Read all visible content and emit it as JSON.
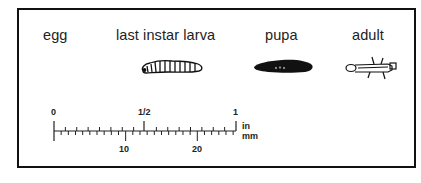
{
  "figure": {
    "stages": [
      {
        "id": "egg",
        "label": "egg"
      },
      {
        "id": "larva",
        "label": "last instar larva"
      },
      {
        "id": "pupa",
        "label": "pupa"
      },
      {
        "id": "adult",
        "label": "adult"
      }
    ],
    "scale_bar": {
      "inch_labels": [
        "0",
        "1/2",
        "1"
      ],
      "mm_labels": [
        "10",
        "20"
      ],
      "unit_top": "in",
      "unit_bottom": "mm",
      "mm_range": [
        0,
        25
      ],
      "inch_range": [
        0,
        1
      ]
    },
    "colors": {
      "ink": "#111111",
      "background": "#ffffff"
    }
  }
}
